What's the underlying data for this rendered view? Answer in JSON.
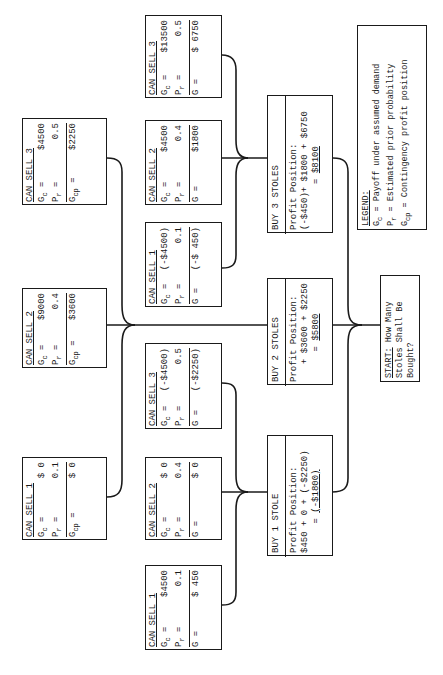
{
  "orientation": "rotated 90deg counter-clockwise",
  "legend": {
    "heading": "LEGEND:",
    "items": [
      {
        "symbol": "G",
        "sub": "c",
        "eq": "=",
        "text": "Payoff under assumed demand"
      },
      {
        "symbol": "P",
        "sub": "r",
        "eq": "=",
        "text": "Estimated prior probability"
      },
      {
        "symbol": "G",
        "sub": "cp",
        "eq": "=",
        "text": "Contingency profit position"
      }
    ]
  },
  "start": {
    "label": "START:",
    "text1": " How Many",
    "text2": "Stoles Shall Be",
    "text3": "Bought?"
  },
  "buy": [
    {
      "id": "buy1",
      "title": "BUY 1 STOLE",
      "profit_label": "Profit Position:",
      "expr": "$450 + 0 + (-$2250)",
      "eq": "=",
      "total": "(-$1800)"
    },
    {
      "id": "buy2",
      "title": "BUY 2 STOLES",
      "profit_label": "Profit Position:",
      "expr": "+ $3600 + $2250",
      "eq": "=",
      "total": "$5800"
    },
    {
      "id": "buy3",
      "title": "BUY 3 STOLES",
      "profit_label": "Profit Position:",
      "expr": "(-$450)+ $1800 + $6750",
      "eq": "=",
      "total": "$8100"
    }
  ],
  "outcomes": {
    "buy1": [
      {
        "title": "CAN SELL 1",
        "gc": "$4500",
        "pr": "0.1",
        "g_label": "G",
        "g_sub": "",
        "g": "$ 450"
      },
      {
        "title": "CAN SELL 2",
        "gc": "$ 0",
        "pr": "0.4",
        "g_label": "G",
        "g_sub": "",
        "g": "$ 0"
      },
      {
        "title": "CAN SELL 3",
        "gc": "(-$4500)",
        "pr": "0.5",
        "g_label": "G",
        "g_sub": "",
        "g": "(-$2250)"
      }
    ],
    "buy2": [
      {
        "title": "CAN SELL 1",
        "gc": "$ 0",
        "pr": "0.1",
        "g_label": "G",
        "g_sub": "cp",
        "g": "$ 0"
      },
      {
        "title": "CAN SELL 2",
        "gc": "$9000",
        "pr": "0.4",
        "g_label": "G",
        "g_sub": "cp",
        "g": "$3600"
      },
      {
        "title": "CAN SELL 3",
        "gc": "$4500",
        "pr": "0.5",
        "g_label": "G",
        "g_sub": "cp",
        "g": "$2250"
      }
    ],
    "buy3": [
      {
        "title": "CAN SELL 1",
        "gc": "(-$4500)",
        "pr": "0.1",
        "g_label": "G",
        "g_sub": "",
        "g": "(-$ 450)"
      },
      {
        "title": "CAN SELL 2",
        "gc": "$4500",
        "pr": "0.4",
        "g_label": "G",
        "g_sub": "",
        "g": "$1800"
      },
      {
        "title": "CAN SELL 3",
        "gc": "$13500",
        "pr": "0.5",
        "g_label": "G",
        "g_sub": "",
        "g": "$ 6750"
      }
    ]
  },
  "symbols": {
    "gc": "G",
    "gc_sub": "c",
    "pr": "P",
    "pr_sub": "r",
    "eq": "="
  }
}
